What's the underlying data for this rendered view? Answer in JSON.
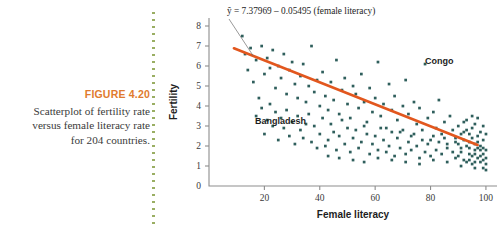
{
  "figure": {
    "number_label": "FIGURE 4.20",
    "caption_line1": "Scatterplot of fertility rate",
    "caption_line2": "versus female literacy rate",
    "caption_line3": "for 204 countries."
  },
  "colors": {
    "figure_number": "#E07B2E",
    "regression_line": "#E2571E",
    "points": "#2F5F5C",
    "axis": "#8D8D8D",
    "divider": "#9AAE63"
  },
  "chart_data": {
    "type": "scatter",
    "title": "",
    "xlabel": "Female literacy",
    "ylabel": "Fertility",
    "xlim": [
      0,
      104
    ],
    "ylim": [
      0,
      8.4
    ],
    "xticks": [
      20,
      40,
      60,
      80,
      100
    ],
    "yticks": [
      0,
      1,
      2,
      3,
      4,
      5,
      6,
      7,
      8
    ],
    "grid": false,
    "legend": null,
    "annotations": [
      {
        "text": "ŷ = 7.37969 – 0.05495 (female literacy)",
        "kind": "equation"
      },
      {
        "text": "Congo",
        "kind": "point-label",
        "x": 78,
        "y": 6.1
      },
      {
        "text": "Bangladesh",
        "kind": "point-label",
        "x": 35,
        "y": 3.1
      }
    ],
    "fit_line": {
      "intercept": 7.37969,
      "slope": -0.05495,
      "x_start": 9,
      "x_end": 97
    },
    "points": [
      [
        12,
        7.5
      ],
      [
        13,
        6.6
      ],
      [
        15,
        6.9
      ],
      [
        17,
        6.3
      ],
      [
        19,
        7.0
      ],
      [
        20,
        5.6
      ],
      [
        21,
        6.4
      ],
      [
        22,
        5.9
      ],
      [
        23,
        6.8
      ],
      [
        24,
        4.9
      ],
      [
        25,
        6.0
      ],
      [
        26,
        5.4
      ],
      [
        27,
        6.6
      ],
      [
        28,
        4.6
      ],
      [
        29,
        5.8
      ],
      [
        30,
        6.2
      ],
      [
        31,
        5.1
      ],
      [
        32,
        4.4
      ],
      [
        33,
        5.5
      ],
      [
        34,
        6.1
      ],
      [
        35,
        4.2
      ],
      [
        36,
        5.0
      ],
      [
        37,
        7.0
      ],
      [
        38,
        4.7
      ],
      [
        39,
        5.3
      ],
      [
        40,
        4.0
      ],
      [
        41,
        5.7
      ],
      [
        42,
        4.5
      ],
      [
        43,
        3.8
      ],
      [
        44,
        5.2
      ],
      [
        45,
        4.3
      ],
      [
        46,
        6.3
      ],
      [
        47,
        3.6
      ],
      [
        48,
        4.8
      ],
      [
        49,
        5.4
      ],
      [
        50,
        4.1
      ],
      [
        51,
        3.4
      ],
      [
        52,
        5.0
      ],
      [
        53,
        4.6
      ],
      [
        54,
        3.9
      ],
      [
        55,
        5.6
      ],
      [
        56,
        4.2
      ],
      [
        57,
        3.2
      ],
      [
        58,
        4.9
      ],
      [
        59,
        3.7
      ],
      [
        60,
        4.4
      ],
      [
        61,
        6.2
      ],
      [
        62,
        3.5
      ],
      [
        63,
        4.1
      ],
      [
        64,
        2.9
      ],
      [
        65,
        5.1
      ],
      [
        66,
        3.8
      ],
      [
        67,
        4.5
      ],
      [
        68,
        3.3
      ],
      [
        69,
        2.7
      ],
      [
        70,
        4.0
      ],
      [
        71,
        5.3
      ],
      [
        72,
        3.6
      ],
      [
        73,
        2.5
      ],
      [
        74,
        4.2
      ],
      [
        75,
        3.1
      ],
      [
        76,
        3.9
      ],
      [
        77,
        2.8
      ],
      [
        78,
        6.1
      ],
      [
        79,
        3.4
      ],
      [
        80,
        2.3
      ],
      [
        81,
        3.7
      ],
      [
        82,
        2.9
      ],
      [
        83,
        4.3
      ],
      [
        84,
        2.6
      ],
      [
        85,
        3.2
      ],
      [
        86,
        2.1
      ],
      [
        87,
        3.5
      ],
      [
        88,
        2.8
      ],
      [
        89,
        2.4
      ],
      [
        90,
        3.0
      ],
      [
        91,
        1.9
      ],
      [
        92,
        2.7
      ],
      [
        93,
        3.3
      ],
      [
        94,
        2.2
      ],
      [
        95,
        2.9
      ],
      [
        96,
        1.8
      ],
      [
        97,
        2.5
      ],
      [
        98,
        2.0
      ],
      [
        99,
        1.6
      ],
      [
        100,
        1.4
      ],
      [
        88,
        1.7
      ],
      [
        89,
        2.2
      ],
      [
        90,
        1.5
      ],
      [
        91,
        2.6
      ],
      [
        92,
        1.3
      ],
      [
        93,
        2.0
      ],
      [
        94,
        1.6
      ],
      [
        95,
        2.4
      ],
      [
        96,
        1.2
      ],
      [
        97,
        1.9
      ],
      [
        98,
        1.5
      ],
      [
        99,
        2.3
      ],
      [
        100,
        1.1
      ],
      [
        99,
        1.3
      ],
      [
        98,
        1.8
      ],
      [
        97,
        1.4
      ],
      [
        96,
        2.1
      ],
      [
        95,
        1.5
      ],
      [
        94,
        1.9
      ],
      [
        93,
        1.2
      ],
      [
        92,
        2.3
      ],
      [
        91,
        1.7
      ],
      [
        90,
        2.1
      ],
      [
        89,
        1.4
      ],
      [
        96,
        3.1
      ],
      [
        97,
        3.4
      ],
      [
        98,
        2.7
      ],
      [
        99,
        3.0
      ],
      [
        95,
        3.5
      ],
      [
        94,
        2.6
      ],
      [
        93,
        2.8
      ],
      [
        92,
        3.2
      ],
      [
        100,
        2.6
      ],
      [
        100,
        1.8
      ],
      [
        99,
        1.9
      ],
      [
        98,
        1.2
      ],
      [
        97,
        2.2
      ],
      [
        96,
        1.6
      ],
      [
        95,
        1.1
      ],
      [
        94,
        1.3
      ],
      [
        86,
        1.9
      ],
      [
        85,
        2.4
      ],
      [
        84,
        1.6
      ],
      [
        83,
        2.2
      ],
      [
        82,
        1.8
      ],
      [
        81,
        2.5
      ],
      [
        80,
        1.5
      ],
      [
        79,
        2.1
      ],
      [
        78,
        1.7
      ],
      [
        77,
        2.3
      ],
      [
        76,
        1.4
      ],
      [
        75,
        2.0
      ],
      [
        74,
        2.6
      ],
      [
        73,
        1.8
      ],
      [
        72,
        2.2
      ],
      [
        71,
        1.6
      ],
      [
        70,
        2.8
      ],
      [
        69,
        1.9
      ],
      [
        68,
        2.4
      ],
      [
        67,
        1.5
      ],
      [
        66,
        2.7
      ],
      [
        65,
        2.0
      ],
      [
        64,
        1.7
      ],
      [
        63,
        2.3
      ],
      [
        62,
        2.9
      ],
      [
        61,
        1.8
      ],
      [
        60,
        2.5
      ],
      [
        59,
        2.1
      ],
      [
        58,
        1.6
      ],
      [
        57,
        2.6
      ],
      [
        56,
        3.0
      ],
      [
        55,
        2.2
      ],
      [
        54,
        1.9
      ],
      [
        53,
        2.8
      ],
      [
        52,
        2.4
      ],
      [
        51,
        1.7
      ],
      [
        50,
        2.9
      ],
      [
        49,
        2.1
      ],
      [
        48,
        3.3
      ],
      [
        47,
        2.5
      ],
      [
        46,
        1.8
      ],
      [
        45,
        2.7
      ],
      [
        44,
        3.1
      ],
      [
        43,
        2.3
      ],
      [
        42,
        2.0
      ],
      [
        41,
        3.4
      ],
      [
        40,
        2.6
      ],
      [
        39,
        1.9
      ],
      [
        38,
        3.0
      ],
      [
        37,
        2.2
      ],
      [
        36,
        3.6
      ],
      [
        35,
        3.1
      ],
      [
        34,
        2.4
      ],
      [
        33,
        2.8
      ],
      [
        32,
        3.5
      ],
      [
        31,
        2.1
      ],
      [
        30,
        3.2
      ],
      [
        29,
        2.5
      ],
      [
        28,
        3.8
      ],
      [
        27,
        2.9
      ],
      [
        26,
        3.4
      ],
      [
        25,
        2.3
      ],
      [
        24,
        3.7
      ],
      [
        23,
        3.0
      ],
      [
        22,
        4.1
      ],
      [
        21,
        3.3
      ],
      [
        20,
        2.6
      ],
      [
        19,
        3.9
      ],
      [
        18,
        4.4
      ],
      [
        17,
        3.5
      ],
      [
        16,
        5.2
      ],
      [
        14,
        5.8
      ],
      [
        43,
        1.5
      ],
      [
        47,
        1.4
      ],
      [
        52,
        1.3
      ],
      [
        56,
        1.2
      ],
      [
        61,
        1.4
      ],
      [
        66,
        1.3
      ],
      [
        71,
        1.2
      ],
      [
        76,
        1.1
      ],
      [
        81,
        1.3
      ],
      [
        86,
        1.2
      ],
      [
        91,
        1.0
      ],
      [
        96,
        0.9
      ],
      [
        99,
        0.9
      ],
      [
        100,
        0.8
      ]
    ]
  }
}
